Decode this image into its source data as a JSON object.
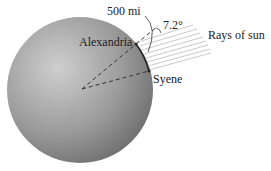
{
  "diagram": {
    "labels": {
      "distance": "500 mi",
      "angle": "7.2°",
      "rays": "Rays of sun",
      "city_a": "Alexandria",
      "city_b": "Syene"
    },
    "colors": {
      "sphere_light": "#c8c8c8",
      "sphere_dark": "#6e6e6e",
      "rays": "#b8b8b8",
      "lines": "#333333"
    }
  }
}
